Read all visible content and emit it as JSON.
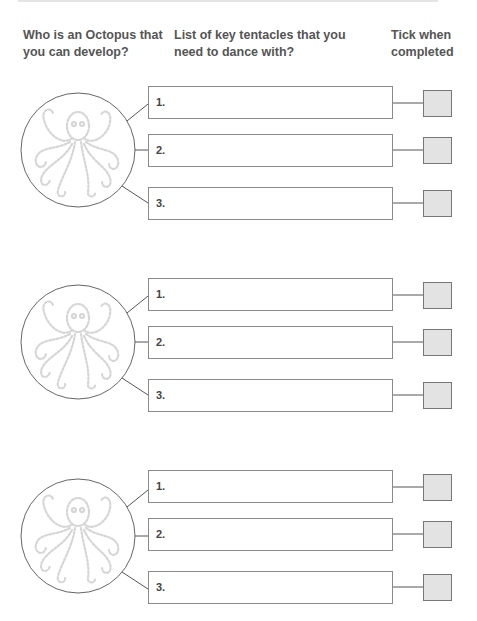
{
  "headers": {
    "col1": [
      "Who is an Octopus that",
      "you can develop?"
    ],
    "col2": [
      "List of key tentacles that you",
      "need to dance with?"
    ],
    "col3": [
      "Tick when",
      "completed"
    ]
  },
  "groups": [
    {
      "items": [
        {
          "number": "1.",
          "value": ""
        },
        {
          "number": "2.",
          "value": ""
        },
        {
          "number": "3.",
          "value": ""
        }
      ],
      "ticks": [
        false,
        false,
        false
      ]
    },
    {
      "items": [
        {
          "number": "1.",
          "value": ""
        },
        {
          "number": "2.",
          "value": ""
        },
        {
          "number": "3.",
          "value": ""
        }
      ],
      "ticks": [
        false,
        false,
        false
      ]
    },
    {
      "items": [
        {
          "number": "1.",
          "value": ""
        },
        {
          "number": "2.",
          "value": ""
        },
        {
          "number": "3.",
          "value": ""
        }
      ],
      "ticks": [
        false,
        false,
        false
      ]
    }
  ],
  "icons": {
    "octopus": "octopus-illustration-icon"
  },
  "colors": {
    "line": "#555555",
    "box_border": "#8a8a8a",
    "checkbox_fill": "#e3e3e3",
    "octopus": "#d9d9d9",
    "header_text": "#555555"
  }
}
